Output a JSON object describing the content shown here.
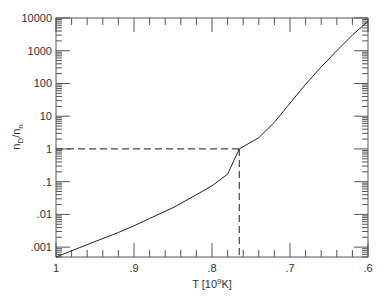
{
  "chart_data": {
    "type": "line",
    "title": "",
    "xlabel": "T [10^9K]",
    "xlabel_parts": {
      "main": "T [10",
      "sup": "9",
      "tail": "K]"
    },
    "ylabel": "n_D/n_n",
    "ylabel_parts": {
      "main": "n",
      "sub1": "D",
      "slash": "/n",
      "sub2": "n"
    },
    "x_scale": "linear",
    "x_reversed": true,
    "xlim": [
      1.0,
      0.6
    ],
    "y_scale": "log",
    "ylim": [
      0.0005,
      10000
    ],
    "x_ticks": [
      {
        "value": 1.0,
        "label": "1"
      },
      {
        "value": 0.9,
        "label": ".9"
      },
      {
        "value": 0.8,
        "label": ".8"
      },
      {
        "value": 0.7,
        "label": ".7"
      },
      {
        "value": 0.6,
        "label": ".6"
      }
    ],
    "x_minor_step": 0.02,
    "y_ticks": [
      {
        "value": 10000,
        "label": "10000"
      },
      {
        "value": 1000,
        "label": "1000"
      },
      {
        "value": 100,
        "label": "100"
      },
      {
        "value": 10,
        "label": "10"
      },
      {
        "value": 1,
        "label": "1"
      },
      {
        "value": 0.1,
        "label": ".1"
      },
      {
        "value": 0.01,
        "label": ".01"
      },
      {
        "value": 0.001,
        "label": ".001"
      }
    ],
    "grid": false,
    "legend": null,
    "series": [
      {
        "name": "n_D/n_n",
        "style": "solid",
        "color": "#222222",
        "x": [
          1.0,
          0.96,
          0.92,
          0.9,
          0.88,
          0.85,
          0.82,
          0.8,
          0.78,
          0.765,
          0.74,
          0.72,
          0.7,
          0.68,
          0.66,
          0.64,
          0.62,
          0.6
        ],
        "y": [
          0.0005,
          0.0012,
          0.0028,
          0.0045,
          0.0075,
          0.016,
          0.04,
          0.075,
          0.17,
          1.0,
          2.2,
          6.5,
          25,
          95,
          320,
          1000,
          3000,
          8000
        ]
      }
    ],
    "annotations": [
      {
        "type": "dashed-hline",
        "y": 1,
        "x_from": 1.0,
        "x_to": 0.765
      },
      {
        "type": "dashed-vline",
        "x": 0.765,
        "y_from": 0.0005,
        "y_to": 1
      }
    ]
  },
  "colors": {
    "axis": "#555555",
    "curve": "#222222",
    "dashed": "#444444",
    "text": "#333333"
  }
}
